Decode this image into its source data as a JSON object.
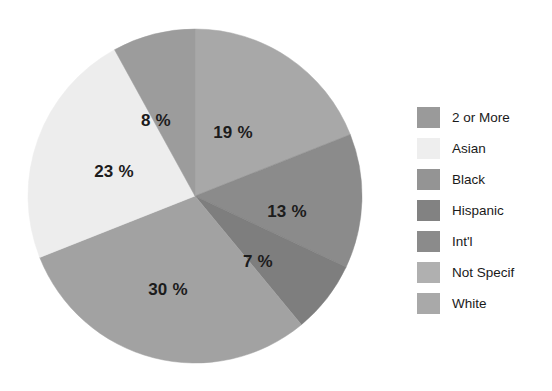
{
  "chart_data": {
    "type": "pie",
    "title": "",
    "xlabel": "",
    "ylabel": "",
    "legend_position": "right",
    "grid": false,
    "value_suffix": "%",
    "categories": [
      "2 or More",
      "Asian",
      "Black",
      "Hispanic",
      "Int'l",
      "Not Specif",
      "White"
    ],
    "legend_colors": [
      "#9a9a9a",
      "#eeeeee",
      "#949494",
      "#828282",
      "#8b8b8b",
      "#b0b0b0",
      "#a9a9a9"
    ],
    "slices": [
      {
        "label": "Not Specif",
        "value": 19,
        "display": "19 %",
        "color": "#a8a8a8",
        "start_angle": 0,
        "end_angle": 68.4,
        "label_x": 233,
        "label_y": 133
      },
      {
        "label": "Hispanic",
        "value": 13,
        "display": "13 %",
        "color": "#8b8b8b",
        "start_angle": 68.4,
        "end_angle": 115.2,
        "label_x": 287,
        "label_y": 212
      },
      {
        "label": "Int'l",
        "value": 7,
        "display": "7 %",
        "color": "#7e7e7e",
        "start_angle": 115.2,
        "end_angle": 140.4,
        "label_x": 258,
        "label_y": 262
      },
      {
        "label": "White",
        "value": 30,
        "display": "30 %",
        "color": "#a2a2a2",
        "start_angle": 140.4,
        "end_angle": 248.4,
        "label_x": 168,
        "label_y": 290
      },
      {
        "label": "Asian",
        "value": 23,
        "display": "23 %",
        "color": "#ededed",
        "start_angle": 248.4,
        "end_angle": 331.2,
        "label_x": 114,
        "label_y": 172
      },
      {
        "label": "2 or More",
        "value": 8,
        "display": "8 %",
        "color": "#9c9c9c",
        "start_angle": 331.2,
        "end_angle": 360,
        "label_x": 156,
        "label_y": 121
      }
    ],
    "geometry": {
      "center_x": 195,
      "center_y": 196,
      "radius": 167
    }
  },
  "legend": {
    "items": [
      {
        "label": "2 or More",
        "color": "#9a9a9a"
      },
      {
        "label": "Asian",
        "color": "#eeeeee"
      },
      {
        "label": "Black",
        "color": "#949494"
      },
      {
        "label": "Hispanic",
        "color": "#828282"
      },
      {
        "label": "Int'l",
        "color": "#8b8b8b"
      },
      {
        "label": "Not Specif",
        "color": "#b0b0b0"
      },
      {
        "label": "White",
        "color": "#a9a9a9"
      }
    ]
  }
}
